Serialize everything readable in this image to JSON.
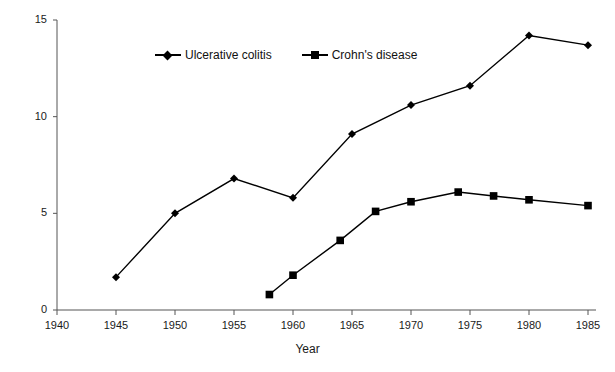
{
  "chart_data": {
    "type": "line",
    "title": "",
    "xlabel": "Year",
    "ylabel": "",
    "xlim": [
      1940,
      1985
    ],
    "ylim": [
      0,
      15
    ],
    "yticks": [
      0,
      5,
      10,
      15
    ],
    "xticks": [
      1940,
      1945,
      1950,
      1955,
      1960,
      1965,
      1970,
      1975,
      1980,
      1985
    ],
    "grid": false,
    "legend_position": "top-center",
    "series": [
      {
        "name": "Ulcerative colitis",
        "marker": "diamond",
        "color": "#000000",
        "points": [
          {
            "x": 1945,
            "y": 1.7
          },
          {
            "x": 1950,
            "y": 5.0
          },
          {
            "x": 1955,
            "y": 6.8
          },
          {
            "x": 1960,
            "y": 5.8
          },
          {
            "x": 1965,
            "y": 9.1
          },
          {
            "x": 1970,
            "y": 10.6
          },
          {
            "x": 1975,
            "y": 11.6
          },
          {
            "x": 1980,
            "y": 14.2
          },
          {
            "x": 1985,
            "y": 13.7
          }
        ]
      },
      {
        "name": "Crohn's disease",
        "marker": "square",
        "color": "#000000",
        "points": [
          {
            "x": 1958,
            "y": 0.8
          },
          {
            "x": 1960,
            "y": 1.8
          },
          {
            "x": 1964,
            "y": 3.6
          },
          {
            "x": 1967,
            "y": 5.1
          },
          {
            "x": 1970,
            "y": 5.6
          },
          {
            "x": 1974,
            "y": 6.1
          },
          {
            "x": 1977,
            "y": 5.9
          },
          {
            "x": 1980,
            "y": 5.7
          },
          {
            "x": 1985,
            "y": 5.4
          }
        ]
      }
    ]
  },
  "axis": {
    "x_title": "Year",
    "x_tick_labels": [
      "1940",
      "1945",
      "1950",
      "1955",
      "1960",
      "1965",
      "1970",
      "1975",
      "1980",
      "1985"
    ],
    "y_tick_labels": [
      "0",
      "5",
      "10",
      "15"
    ]
  },
  "legend": {
    "items": [
      {
        "label": "Ulcerative colitis",
        "marker": "diamond"
      },
      {
        "label": "Crohn's disease",
        "marker": "square"
      }
    ]
  }
}
